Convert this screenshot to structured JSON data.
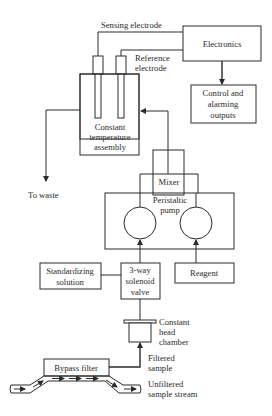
{
  "diagram": {
    "labels": {
      "sensing_electrode": "Sensing electrode",
      "reference_electrode_1": "Reference",
      "reference_electrode_2": "electrode",
      "to_waste": "To waste",
      "constant_head_1": "Constant",
      "constant_head_2": "head",
      "constant_head_3": "chamber",
      "filtered_1": "Filtered",
      "filtered_2": "sample",
      "unfiltered_1": "Unfiltered",
      "unfiltered_2": "sample stream"
    },
    "boxes": {
      "electronics": "Electronics",
      "control_1": "Control and",
      "control_2": "alarming",
      "control_3": "outputs",
      "assembly_1": "Constant",
      "assembly_2": "temperature",
      "assembly_3": "assembly",
      "mixer": "Mixer",
      "pump_1": "Peristaltic",
      "pump_2": "pump",
      "standardizing_1": "Standardizing",
      "standardizing_2": "solution",
      "valve_1": "3-way",
      "valve_2": "solenoid",
      "valve_3": "valve",
      "reagent": "Reagent",
      "bypass_filter": "Bypass filter"
    }
  }
}
